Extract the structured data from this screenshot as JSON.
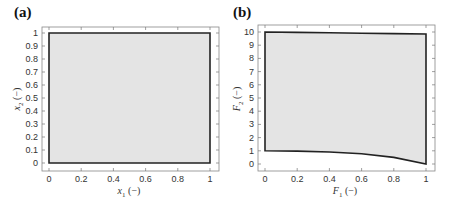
{
  "chart_data": [
    {
      "type": "area",
      "panel_label": "(a)",
      "title": "",
      "xlabel": "x1 (−)",
      "ylabel": "x2 (−)",
      "xlim": [
        0,
        1
      ],
      "ylim": [
        0,
        1
      ],
      "xticks": [
        "0",
        "0.2",
        "0.4",
        "0.6",
        "0.8",
        "1"
      ],
      "yticks": [
        "0",
        "0.1",
        "0.2",
        "0.3",
        "0.4",
        "0.5",
        "0.6",
        "0.7",
        "0.8",
        "0.9",
        "1"
      ],
      "grid": false,
      "fill_color": "#e4e4e4",
      "edge_color": "#222222",
      "region": {
        "name": "feasible decision space",
        "boundary": [
          [
            0,
            0
          ],
          [
            1,
            0
          ],
          [
            1,
            1
          ],
          [
            0,
            1
          ],
          [
            0,
            0
          ]
        ]
      }
    },
    {
      "type": "area",
      "panel_label": "(b)",
      "title": "",
      "xlabel": "F1 (−)",
      "ylabel": "F2 (−)",
      "xlim": [
        0,
        1
      ],
      "ylim": [
        0,
        10
      ],
      "xticks": [
        "0",
        "0.2",
        "0.4",
        "0.6",
        "0.8",
        "1"
      ],
      "yticks": [
        "0",
        "1",
        "2",
        "3",
        "4",
        "5",
        "6",
        "7",
        "8",
        "9",
        "10"
      ],
      "grid": false,
      "fill_color": "#e4e4e4",
      "edge_color": "#222222",
      "region": {
        "name": "objective space",
        "top_edge": [
          [
            0,
            10
          ],
          [
            0.2,
            9.97
          ],
          [
            0.4,
            9.94
          ],
          [
            0.6,
            9.91
          ],
          [
            0.8,
            9.88
          ],
          [
            1,
            9.85
          ]
        ],
        "bottom_edge": [
          [
            0,
            1
          ],
          [
            0.2,
            0.98
          ],
          [
            0.4,
            0.91
          ],
          [
            0.6,
            0.77
          ],
          [
            0.8,
            0.5
          ],
          [
            1,
            0
          ]
        ],
        "left_edge": [
          [
            0,
            1
          ],
          [
            0,
            10
          ]
        ],
        "right_edge": [
          [
            1,
            0
          ],
          [
            1,
            9.85
          ]
        ]
      }
    }
  ],
  "panels": {
    "a": {
      "label": "(a)",
      "xlabel_var": "x",
      "xlabel_sub": "1",
      "xlabel_unit": " (−)",
      "ylabel_var": "x",
      "ylabel_sub": "2",
      "ylabel_unit": " (−)"
    },
    "b": {
      "label": "(b)",
      "xlabel_var": "F",
      "xlabel_sub": "1",
      "xlabel_unit": " (−)",
      "ylabel_var": "F",
      "ylabel_sub": "2",
      "ylabel_unit": " (−)"
    }
  }
}
